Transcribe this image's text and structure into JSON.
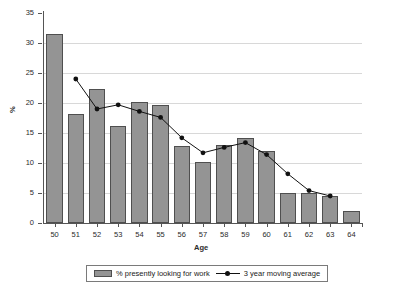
{
  "chart_data": {
    "type": "bar",
    "title": "",
    "subtitle": "",
    "xlabel": "Age",
    "ylabel": "%",
    "categories": [
      "50",
      "51",
      "52",
      "53",
      "54",
      "55",
      "56",
      "57",
      "58",
      "59",
      "60",
      "61",
      "62",
      "63",
      "64"
    ],
    "ylim": [
      0,
      35
    ],
    "yticks": [
      0,
      5,
      10,
      15,
      20,
      25,
      30,
      35
    ],
    "grid": true,
    "grid_axis": "y",
    "legend_position": "bottom-center-boxed",
    "series": [
      {
        "name": "% presently looking for work",
        "type": "bar",
        "color": "#949494",
        "edge_color": "#4f4f4f",
        "values": [
          31.5,
          18.2,
          22.3,
          16.2,
          20.2,
          19.6,
          12.8,
          10.2,
          13.0,
          14.2,
          12.0,
          5.0,
          5.0,
          4.5,
          2.0
        ]
      },
      {
        "name": "3 year moving average",
        "type": "line",
        "color": "#111111",
        "marker": "filled-circle",
        "x": [
          "51",
          "52",
          "53",
          "54",
          "55",
          "56",
          "57",
          "58",
          "59",
          "60",
          "61",
          "62",
          "63"
        ],
        "values": [
          24.0,
          19.0,
          19.7,
          18.6,
          17.6,
          14.2,
          11.7,
          12.6,
          13.4,
          11.4,
          8.2,
          5.4,
          4.5
        ]
      }
    ],
    "annotations": []
  },
  "legend": {
    "bar_label": "% presently looking for work",
    "line_label": "3 year moving average"
  },
  "axes": {
    "y_title": "%",
    "x_title": "Age"
  }
}
